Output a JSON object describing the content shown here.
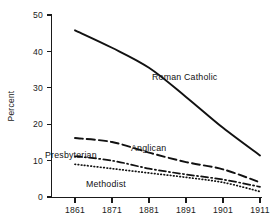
{
  "chart_data": {
    "type": "line",
    "title": "",
    "subtitle": "",
    "xlabel": "",
    "ylabel": "Percent",
    "xlim": [
      1861,
      1911
    ],
    "ylim": [
      0,
      50
    ],
    "grid": false,
    "legend_position": "inline-annotations",
    "x": [
      1861,
      1871,
      1881,
      1891,
      1901,
      1911
    ],
    "xticklabels": [
      "1861",
      "1871",
      "1881",
      "1891",
      "1901",
      "1911"
    ],
    "yticks": [
      0,
      10,
      20,
      30,
      40,
      50
    ],
    "yticklabels": [
      "0",
      "10",
      "20",
      "30",
      "40",
      "50"
    ],
    "series": [
      {
        "name": "Roman Catholic",
        "style": "solid",
        "label": "Roman Catholic",
        "values": [
          45.8,
          41.0,
          35.5,
          27.5,
          19.0,
          11.4
        ]
      },
      {
        "name": "Anglican",
        "style": "dashed",
        "label": "Anglican",
        "values": [
          16.2,
          15.1,
          12.2,
          9.6,
          7.6,
          4.0
        ]
      },
      {
        "name": "Presbyterian",
        "style": "dash-dot",
        "label": "Presbyterian",
        "values": [
          11.2,
          10.0,
          7.8,
          6.2,
          4.8,
          2.8
        ]
      },
      {
        "name": "Methodist",
        "style": "dotted",
        "label": "Methodist",
        "values": [
          9.0,
          7.8,
          6.6,
          5.4,
          4.0,
          1.5
        ]
      }
    ]
  },
  "axes": {
    "y_title": "Percent",
    "y_labels": [
      "50",
      "40",
      "30",
      "20",
      "10",
      "0"
    ],
    "x_labels": [
      "1861",
      "1871",
      "1881",
      "1891",
      "1901",
      "1911"
    ]
  },
  "annotations": {
    "roman_catholic": "Roman Catholic",
    "anglican": "Anglican",
    "presbyterian": "Presbyterian",
    "methodist": "Methodist"
  }
}
